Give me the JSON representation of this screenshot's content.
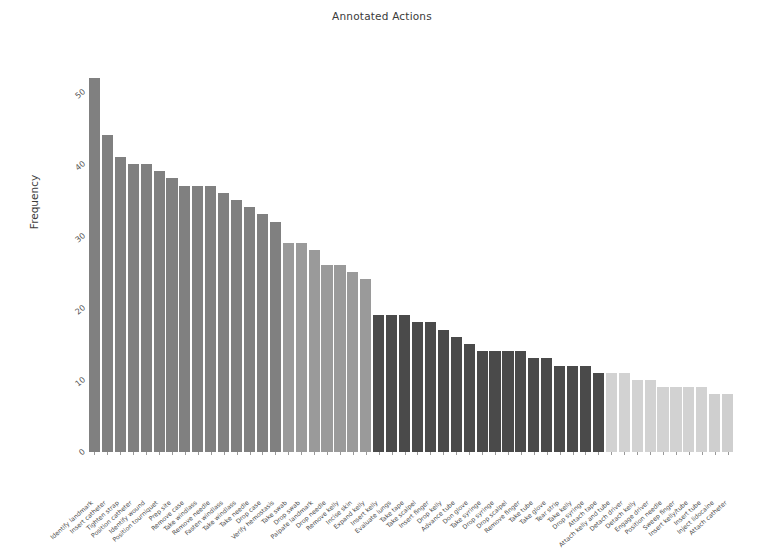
{
  "chart_data": {
    "type": "bar",
    "title": "Annotated Actions",
    "xlabel": "",
    "ylabel": "Frequency",
    "ylim": [
      0,
      55
    ],
    "yticks": [
      0,
      10,
      20,
      30,
      40,
      50
    ],
    "grid": false,
    "legend": "none",
    "categories": [
      "Identify landmark",
      "Insert catheter",
      "Tighten strap",
      "Position catheter",
      "Identify wound",
      "Position tourniquet",
      "Prep site",
      "Remove case",
      "Take windlass",
      "Remove needle",
      "Fasten windlass",
      "Take windlass",
      "Take needle",
      "Drop case",
      "Verify hemostasis",
      "Take swab",
      "Drop swab",
      "Palpate landmark",
      "Drop needle",
      "Remove kelly",
      "Incise skin",
      "Expand kelly",
      "Insert kelly",
      "Evaluate lungs",
      "Take tape",
      "Take scalpel",
      "Insert finger",
      "Drop kelly",
      "Advance tube",
      "Don glove",
      "Take syringe",
      "Drop syringe",
      "Drop scalpel",
      "Remove finger",
      "Take tube",
      "Take glove",
      "Tear strip",
      "Take kelly",
      "Drop syringe",
      "Attach tape",
      "Attach kelly and tube",
      "Detach driver",
      "Detach kelly",
      "Engage driver",
      "Position needle",
      "Sweep finger",
      "Insert kelly/tube",
      "Insert tube",
      "Inject lidocaine",
      "Attach catheter"
    ],
    "values": [
      52,
      44,
      41,
      40,
      40,
      39,
      38,
      37,
      37,
      37,
      36,
      35,
      34,
      33,
      32,
      29,
      29,
      28,
      26,
      26,
      25,
      24,
      19,
      19,
      19,
      18,
      18,
      17,
      16,
      15,
      14,
      14,
      14,
      14,
      13,
      13,
      12,
      12,
      12,
      11,
      11,
      11,
      10,
      10,
      9,
      9,
      9,
      9,
      8,
      8
    ],
    "bar_colors": [
      "#808080",
      "#808080",
      "#808080",
      "#808080",
      "#808080",
      "#808080",
      "#808080",
      "#808080",
      "#808080",
      "#808080",
      "#808080",
      "#808080",
      "#808080",
      "#808080",
      "#808080",
      "#9a9a9a",
      "#9a9a9a",
      "#9a9a9a",
      "#9a9a9a",
      "#9a9a9a",
      "#9a9a9a",
      "#9a9a9a",
      "#4a4a4a",
      "#4a4a4a",
      "#4a4a4a",
      "#4a4a4a",
      "#4a4a4a",
      "#4a4a4a",
      "#4a4a4a",
      "#4a4a4a",
      "#4a4a4a",
      "#4a4a4a",
      "#4a4a4a",
      "#4a4a4a",
      "#4a4a4a",
      "#4a4a4a",
      "#4a4a4a",
      "#4a4a4a",
      "#4a4a4a",
      "#4a4a4a",
      "#d2d2d2",
      "#d2d2d2",
      "#d2d2d2",
      "#d2d2d2",
      "#d2d2d2",
      "#d2d2d2",
      "#d2d2d2",
      "#d2d2d2",
      "#cfcfcf",
      "#cfcfcf"
    ]
  }
}
